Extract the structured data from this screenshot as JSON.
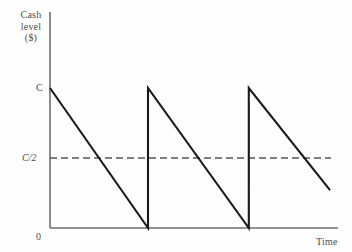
{
  "chart": {
    "y_axis_title_lines": [
      "Cash",
      "level",
      "($)"
    ],
    "x_axis_title": "Time",
    "y_tick_top": "C",
    "y_tick_mid": "C/2",
    "y_tick_zero": "0",
    "line_color": "#1a1a1a",
    "axis_color": "#6e6e6e",
    "dashed_color": "#555555",
    "background": "#fefefe"
  },
  "chart_data": {
    "type": "line",
    "title": "",
    "xlabel": "Time",
    "ylabel": "Cash level ($)",
    "grid": false,
    "legend": "none",
    "xlim": [
      0,
      1
    ],
    "ylim": [
      0,
      1
    ],
    "x_ticks": [
      0
    ],
    "x_tick_labels": [
      "0"
    ],
    "y_ticks": [
      0,
      0.5,
      1
    ],
    "y_tick_labels": [
      "0",
      "C/2",
      "C"
    ],
    "annotations": [
      {
        "text": "C/2",
        "type": "dashed-reference-line",
        "y": 0.5
      }
    ],
    "series": [
      {
        "name": "Cash balance (sawtooth)",
        "style": "solid",
        "points": [
          {
            "x": 0.0,
            "y": 1.0
          },
          {
            "x": 0.35,
            "y": 0.0
          },
          {
            "x": 0.35,
            "y": 1.0
          },
          {
            "x": 0.71,
            "y": 0.0
          },
          {
            "x": 0.71,
            "y": 1.0
          },
          {
            "x": 1.0,
            "y": 0.27
          }
        ]
      },
      {
        "name": "Average cash level C/2",
        "style": "dashed",
        "points": [
          {
            "x": 0.0,
            "y": 0.5
          },
          {
            "x": 1.0,
            "y": 0.5
          }
        ]
      }
    ]
  }
}
